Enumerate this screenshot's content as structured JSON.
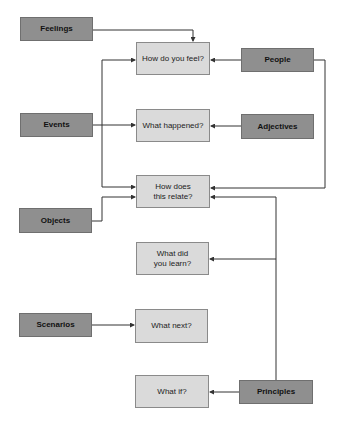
{
  "diagram": {
    "sources": {
      "feelings": "Feelings",
      "events": "Events",
      "objects": "Objects",
      "scenarios": "Scenarios",
      "people": "People",
      "adjectives": "Adjectives",
      "principles": "Principles"
    },
    "questions": {
      "how_feel": "How do you feel?",
      "what_happened": "What happened?",
      "relate_1": "How does",
      "relate_2": "this relate?",
      "learn_1": "What did",
      "learn_2": "you learn?",
      "what_next": "What next?",
      "what_if": "What if?"
    },
    "colors": {
      "source_fill": "#8f8f8f",
      "question_fill": "#dadada",
      "line": "#333333"
    },
    "edges": [
      {
        "from": "Feelings",
        "to": "How do you feel?"
      },
      {
        "from": "People",
        "to": "How do you feel?"
      },
      {
        "from": "People",
        "to": "How does this relate?"
      },
      {
        "from": "Events",
        "to": "How do you feel?"
      },
      {
        "from": "Events",
        "to": "What happened?"
      },
      {
        "from": "Events",
        "to": "How does this relate?"
      },
      {
        "from": "Adjectives",
        "to": "What happened?"
      },
      {
        "from": "Objects",
        "to": "How does this relate?"
      },
      {
        "from": "Principles",
        "to": "How does this relate?"
      },
      {
        "from": "Principles",
        "to": "What did you learn?"
      },
      {
        "from": "Principles",
        "to": "What if?"
      },
      {
        "from": "Scenarios",
        "to": "What next?"
      }
    ]
  }
}
